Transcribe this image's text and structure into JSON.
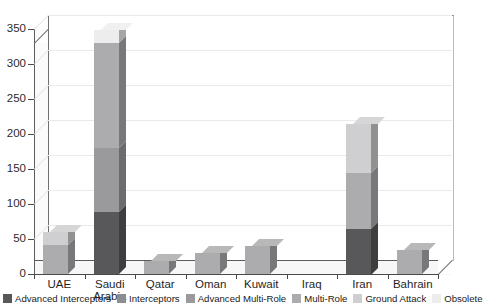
{
  "chart_data": {
    "type": "bar",
    "subtype": "stacked-column-3d",
    "title": "",
    "xlabel": "",
    "ylabel": "",
    "ylim": [
      0,
      350
    ],
    "ytick_step": 50,
    "yticks": [
      0,
      50,
      100,
      150,
      200,
      250,
      300,
      350
    ],
    "grid": true,
    "legend_position": "bottom",
    "categories": [
      "UAE",
      "Saudi Arabia",
      "Qatar",
      "Oman",
      "Kuwait",
      "Iraq",
      "Iran",
      "Bahrain"
    ],
    "category_lines": [
      [
        "UAE"
      ],
      [
        "Saudi",
        "Arabia"
      ],
      [
        "Qatar"
      ],
      [
        "Oman"
      ],
      [
        "Kuwait"
      ],
      [
        "Iraq"
      ],
      [
        "Iran"
      ],
      [
        "Bahrain"
      ]
    ],
    "series": [
      {
        "name": "Advanced Interceptors",
        "color": "#58585a",
        "values": [
          0,
          88,
          0,
          0,
          0,
          0,
          65,
          0
        ]
      },
      {
        "name": "Interceptors",
        "color": "#8d8d8f",
        "values": [
          0,
          0,
          0,
          0,
          0,
          0,
          0,
          0
        ]
      },
      {
        "name": "Advanced Multi-Role",
        "color": "#9a9a9c",
        "values": [
          0,
          92,
          0,
          0,
          0,
          0,
          0,
          0
        ]
      },
      {
        "name": "Multi-Role",
        "color": "#acacae",
        "values": [
          42,
          150,
          18,
          30,
          40,
          0,
          80,
          34
        ]
      },
      {
        "name": "Ground Attack",
        "color": "#cfcfd1",
        "values": [
          18,
          0,
          0,
          0,
          0,
          0,
          70,
          0
        ]
      },
      {
        "name": "Obsolete",
        "color": "#ededee",
        "values": [
          0,
          18,
          0,
          0,
          0,
          0,
          0,
          0
        ]
      }
    ],
    "totals": [
      60,
      348,
      18,
      30,
      40,
      0,
      215,
      34
    ]
  },
  "axis": {
    "y_tick_labels": [
      "0",
      "50",
      "100",
      "150",
      "200",
      "250",
      "300",
      "350"
    ]
  },
  "legend": {
    "items": [
      {
        "label": "Advanced Interceptors",
        "color": "#58585a"
      },
      {
        "label": "Interceptors",
        "color": "#8d8d8f"
      },
      {
        "label": "Advanced Multi-Role",
        "color": "#9a9a9c"
      },
      {
        "label": "Multi-Role",
        "color": "#acacae"
      },
      {
        "label": "Ground Attack",
        "color": "#cfcfd1"
      },
      {
        "label": "Obsolete",
        "color": "#ededee"
      }
    ]
  }
}
